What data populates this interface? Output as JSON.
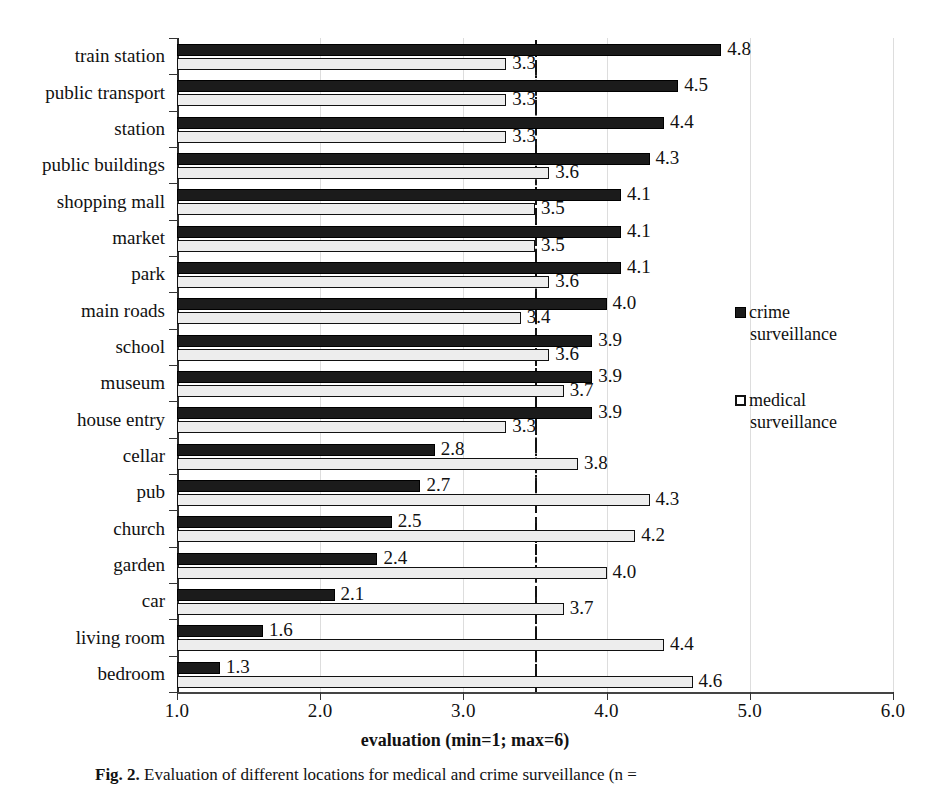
{
  "chart_data": {
    "type": "bar",
    "orientation": "horizontal",
    "title": "",
    "xlabel": "evaluation (min=1; max=6)",
    "ylabel": "",
    "xlim": [
      1.0,
      6.0
    ],
    "xticks": [
      "1.0",
      "2.0",
      "3.0",
      "4.0",
      "5.0",
      "6.0"
    ],
    "grid": true,
    "legend_position": "right",
    "reference_line": 3.5,
    "categories": [
      "train station",
      "public transport",
      "station",
      "public buildings",
      "shopping mall",
      "market",
      "park",
      "main roads",
      "school",
      "museum",
      "house entry",
      "cellar",
      "pub",
      "church",
      "garden",
      "car",
      "living room",
      "bedroom"
    ],
    "series": [
      {
        "name": "crime surveillance",
        "color": "#1b1b1b",
        "values": [
          4.8,
          4.5,
          4.4,
          4.3,
          4.1,
          4.1,
          4.1,
          4.0,
          3.9,
          3.9,
          3.9,
          2.8,
          2.7,
          2.5,
          2.4,
          2.1,
          1.6,
          1.3
        ],
        "labels": [
          "4.8",
          "4.5",
          "4.4",
          "4.3",
          "4.1",
          "4.1",
          "4.1",
          "4.0",
          "3.9",
          "3.9",
          "3.9",
          "2.8",
          "2.7",
          "2.5",
          "2.4",
          "2.1",
          "1.6",
          "1.3"
        ]
      },
      {
        "name": "medical surveillance",
        "color": "#ededed",
        "values": [
          3.3,
          3.3,
          3.3,
          3.6,
          3.5,
          3.5,
          3.6,
          3.4,
          3.6,
          3.7,
          3.3,
          3.8,
          4.3,
          4.2,
          4.0,
          3.7,
          4.4,
          4.6
        ],
        "labels": [
          "3.3",
          "3.3",
          "3.3",
          "3.6",
          "3.5",
          "3.5",
          "3.6",
          "3.4",
          "3.6",
          "3.7",
          "3.3",
          "3.8",
          "4.3",
          "4.2",
          "4.0",
          "3.7",
          "4.4",
          "4.6"
        ]
      }
    ]
  },
  "legend": {
    "entries": [
      {
        "line1": "crime",
        "line2": "surveillance",
        "swatch": "filled-square-icon"
      },
      {
        "line1": "medical",
        "line2": "surveillance",
        "swatch": "open-square-icon"
      }
    ]
  },
  "caption": {
    "figure_number": "Fig. 2.",
    "text": "Evaluation of different locations for medical and crime surveillance (n ="
  }
}
